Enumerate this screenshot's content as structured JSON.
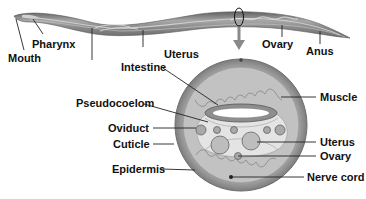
{
  "diagram": {
    "colors": {
      "body_dark": "#7a7a7a",
      "body_mid": "#9c9c9c",
      "body_light": "#c9c9c9",
      "cuticle": "#8c8c8c",
      "muscle": "#b5b5b5",
      "pseudocoelom": "#e2e2e2",
      "leader_line": "#222222",
      "arrow": "#8a8a8a",
      "label_text": "#111111"
    },
    "labels": {
      "mouth": "Mouth",
      "pharynx": "Pharynx",
      "uterus_top": "Uterus",
      "ovary_top": "Ovary",
      "anus": "Anus",
      "intestine": "Intestine",
      "pseudocoelom": "Pseudocoelom",
      "oviduct": "Oviduct",
      "cuticle": "Cuticle",
      "epidermis": "Epidermis",
      "muscle": "Muscle",
      "uterus_cross": "Uterus",
      "ovary_cross": "Ovary",
      "nerve_cord": "Nerve cord"
    }
  }
}
